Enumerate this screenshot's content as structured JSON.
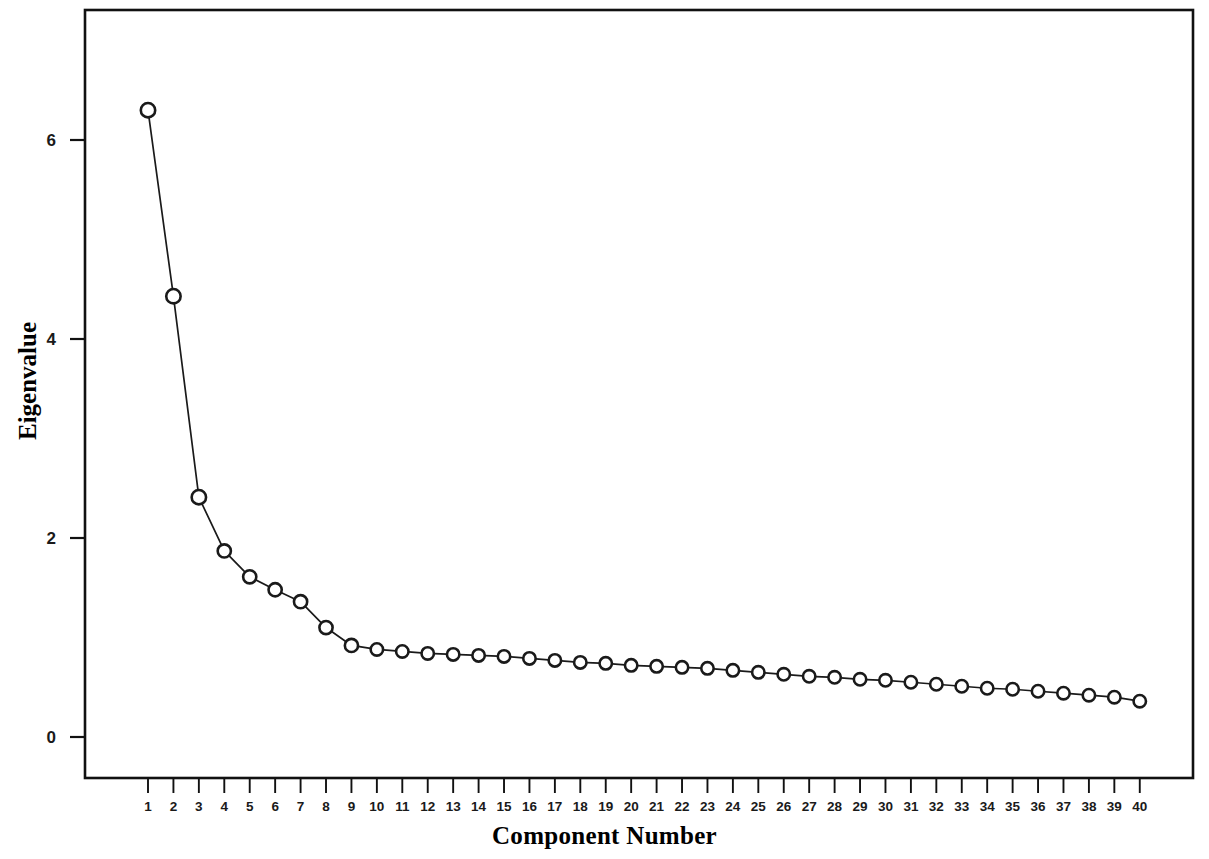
{
  "chart_data": {
    "type": "line",
    "title": "",
    "xlabel": "Component Number",
    "ylabel": "Eigenvalue",
    "xlim": [
      0.3,
      41.0
    ],
    "ylim": [
      -0.55,
      7.05
    ],
    "grid": false,
    "legend": "none",
    "marker": "open-circle",
    "line_color": "#1a1a1a",
    "marker_edge_color": "#1a1a1a",
    "marker_face_color": "#ffffff",
    "x_tick_labels": [
      "1",
      "2",
      "3",
      "4",
      "5",
      "6",
      "7",
      "8",
      "9",
      "10",
      "11",
      "12",
      "13",
      "14",
      "15",
      "16",
      "17",
      "18",
      "19",
      "20",
      "21",
      "22",
      "23",
      "24",
      "25",
      "26",
      "27",
      "28",
      "29",
      "30",
      "31",
      "32",
      "33",
      "34",
      "35",
      "36",
      "37",
      "38",
      "39",
      "40"
    ],
    "y_tick_labels": [
      "0",
      "2",
      "4",
      "6"
    ],
    "y_ticks": [
      0,
      2,
      4,
      6
    ],
    "categories": [
      1,
      2,
      3,
      4,
      5,
      6,
      7,
      8,
      9,
      10,
      11,
      12,
      13,
      14,
      15,
      16,
      17,
      18,
      19,
      20,
      21,
      22,
      23,
      24,
      25,
      26,
      27,
      28,
      29,
      30,
      31,
      32,
      33,
      34,
      35,
      36,
      37,
      38,
      39,
      40
    ],
    "values": [
      6.3,
      4.43,
      2.41,
      1.87,
      1.61,
      1.48,
      1.36,
      1.1,
      0.92,
      0.88,
      0.86,
      0.84,
      0.83,
      0.82,
      0.81,
      0.79,
      0.77,
      0.75,
      0.74,
      0.72,
      0.71,
      0.7,
      0.69,
      0.67,
      0.65,
      0.63,
      0.61,
      0.6,
      0.58,
      0.57,
      0.55,
      0.53,
      0.51,
      0.49,
      0.48,
      0.46,
      0.44,
      0.42,
      0.4,
      0.36
    ],
    "series": [
      {
        "name": "Eigenvalue",
        "values": [
          6.3,
          4.43,
          2.41,
          1.87,
          1.61,
          1.48,
          1.36,
          1.1,
          0.92,
          0.88,
          0.86,
          0.84,
          0.83,
          0.82,
          0.81,
          0.79,
          0.77,
          0.75,
          0.74,
          0.72,
          0.71,
          0.7,
          0.69,
          0.67,
          0.65,
          0.63,
          0.61,
          0.6,
          0.58,
          0.57,
          0.55,
          0.53,
          0.51,
          0.49,
          0.48,
          0.46,
          0.44,
          0.42,
          0.4,
          0.36
        ]
      }
    ]
  },
  "axes": {
    "y_title": "Eigenvalue",
    "x_title": "Component Number"
  },
  "colors": {
    "line": "#1a1a1a",
    "frame": "#111111",
    "background": "#ffffff"
  }
}
